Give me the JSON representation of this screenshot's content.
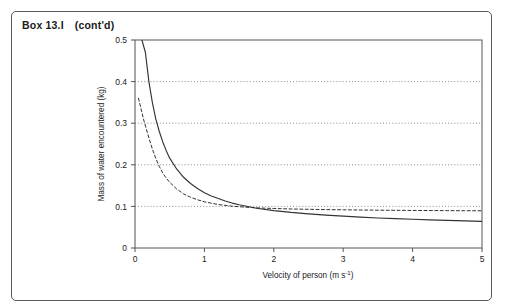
{
  "box": {
    "label": "Box",
    "number": "13.I",
    "continued": "(cont'd)"
  },
  "chart_data": {
    "type": "line",
    "title": "",
    "xlabel": "Velocity of person (m s",
    "xlabel_sup": "-1",
    "xlabel_tail": ")",
    "ylabel": "Mass of water encountered (kg)",
    "xlim": [
      0,
      5
    ],
    "ylim": [
      0,
      0.5
    ],
    "xticks": [
      "0",
      "1",
      "2",
      "3",
      "4",
      "5"
    ],
    "xtick_values": [
      0,
      1,
      2,
      3,
      4,
      5
    ],
    "yticks": [
      "0",
      "0.1",
      "0.2",
      "0.3",
      "0.4",
      "0.5"
    ],
    "ytick_values": [
      0,
      0.1,
      0.2,
      0.3,
      0.4,
      0.5
    ],
    "grid": "horizontal-dotted",
    "gridlines": [
      0.1,
      0.2,
      0.3,
      0.4
    ],
    "legend": "none",
    "axis_color": "#555555",
    "grid_color": "#777777",
    "curve_color": "#333333",
    "series": [
      {
        "name": "standing person (solid)",
        "style": "solid",
        "x": [
          0.1,
          0.15,
          0.2,
          0.25,
          0.3,
          0.35,
          0.4,
          0.45,
          0.5,
          0.6,
          0.7,
          0.8,
          0.9,
          1.0,
          1.1,
          1.2,
          1.3,
          1.4,
          1.5,
          1.75,
          2.0,
          2.25,
          2.5,
          2.75,
          3.0,
          3.25,
          3.5,
          3.75,
          4.0,
          4.25,
          4.5,
          4.75,
          5.0
        ],
        "y": [
          0.5,
          0.47,
          0.4,
          0.35,
          0.31,
          0.28,
          0.255,
          0.234,
          0.216,
          0.19,
          0.17,
          0.155,
          0.143,
          0.133,
          0.125,
          0.119,
          0.113,
          0.108,
          0.104,
          0.0955,
          0.09,
          0.0855,
          0.082,
          0.079,
          0.0765,
          0.0742,
          0.0722,
          0.0705,
          0.069,
          0.0676,
          0.0663,
          0.0652,
          0.064
        ]
      },
      {
        "name": "crouching person (dashed)",
        "style": "dashed",
        "x": [
          0.05,
          0.08,
          0.1,
          0.13,
          0.16,
          0.2,
          0.25,
          0.3,
          0.35,
          0.4,
          0.45,
          0.5,
          0.6,
          0.7,
          0.8,
          0.9,
          1.0,
          1.2,
          1.4,
          1.6,
          1.8,
          2.0,
          2.25,
          2.5,
          2.75,
          3.0,
          3.25,
          3.5,
          3.75,
          4.0,
          4.25,
          4.5,
          4.75,
          5.0
        ],
        "y": [
          0.36,
          0.34,
          0.325,
          0.305,
          0.288,
          0.265,
          0.238,
          0.215,
          0.196,
          0.18,
          0.168,
          0.158,
          0.142,
          0.13,
          0.122,
          0.116,
          0.111,
          0.1045,
          0.1005,
          0.098,
          0.0962,
          0.095,
          0.0938,
          0.093,
          0.0923,
          0.0918,
          0.0913,
          0.0909,
          0.0906,
          0.0903,
          0.09,
          0.0898,
          0.0896,
          0.0894
        ]
      }
    ]
  }
}
